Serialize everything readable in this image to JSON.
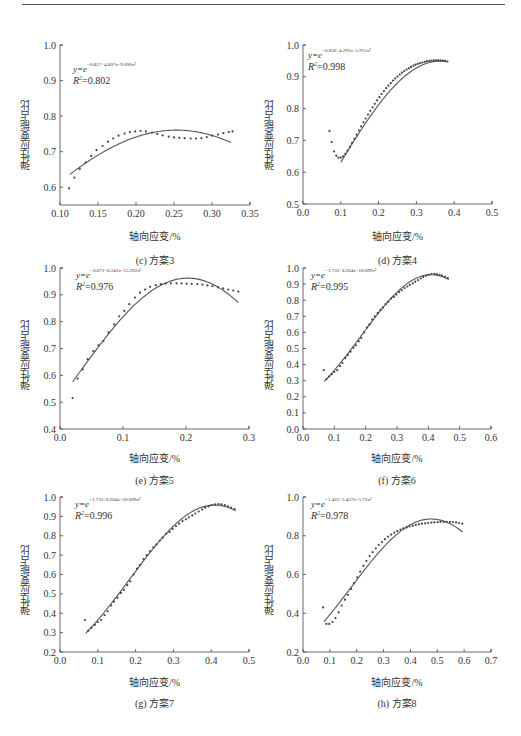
{
  "page": {
    "ylabel": "弹性应变能占比",
    "xlabel": "轴向应变/%"
  },
  "chart_data": [
    {
      "id": "c",
      "type": "scatter",
      "caption": "(c)  方案3",
      "title": "方案3",
      "xlabel": "轴向应变/%",
      "ylabel": "弹性应变能占比",
      "xlim": [
        0.1,
        0.35
      ],
      "ylim": [
        0.55,
        1.0
      ],
      "xticks": [
        "0.10",
        "0.15",
        "0.20",
        "0.25",
        "0.30",
        "0.35"
      ],
      "yticks": [
        "0.6",
        "0.7",
        "0.8",
        "0.9",
        "1.0"
      ],
      "equation": "y=e^(-0.857+4.607x-9.096x^2)",
      "equation_base": "y=e",
      "equation_exp": "−0.857+4.607x−9.096x²",
      "r2": "R²=0.802",
      "r2_value": "0.802",
      "fit": {
        "a": -0.857,
        "b": 4.607,
        "c": -9.096,
        "xrange": [
          0.113,
          0.325
        ]
      },
      "points_x": [
        0.112,
        0.119,
        0.126,
        0.134,
        0.141,
        0.148,
        0.156,
        0.163,
        0.17,
        0.177,
        0.185,
        0.192,
        0.199,
        0.206,
        0.213,
        0.221,
        0.228,
        0.235,
        0.243,
        0.25,
        0.257,
        0.264,
        0.272,
        0.279,
        0.286,
        0.293,
        0.3,
        0.308,
        0.315,
        0.322,
        0.327
      ],
      "points_y": [
        0.597,
        0.627,
        0.651,
        0.67,
        0.688,
        0.704,
        0.716,
        0.728,
        0.737,
        0.745,
        0.751,
        0.755,
        0.757,
        0.758,
        0.757,
        0.754,
        0.75,
        0.746,
        0.742,
        0.74,
        0.739,
        0.738,
        0.737,
        0.737,
        0.738,
        0.741,
        0.745,
        0.748,
        0.752,
        0.755,
        0.757
      ]
    },
    {
      "id": "d",
      "type": "scatter",
      "caption": "(d)  方案4",
      "title": "方案4",
      "xlabel": "轴向应变/%",
      "ylabel": "弹性应变能占比",
      "xlim": [
        0.0,
        0.5
      ],
      "ylim": [
        0.5,
        1.0
      ],
      "xticks": [
        "0.0",
        "0.1",
        "0.2",
        "0.3",
        "0.4",
        "0.5"
      ],
      "yticks": [
        "0.5",
        "0.6",
        "0.7",
        "0.8",
        "0.9",
        "1.0"
      ],
      "equation": "y=e^(-0.830+4.291x-5.915x^2)",
      "equation_base": "y=e",
      "equation_exp": "−0.830+4.291x−5.915x²",
      "r2": "R²=0.998",
      "r2_value": "0.998",
      "fit": {
        "a": -0.83,
        "b": 4.291,
        "c": -5.915,
        "xrange": [
          0.1,
          0.38
        ]
      },
      "points_x": [
        0.07,
        0.076,
        0.082,
        0.088,
        0.094,
        0.1,
        0.106,
        0.112,
        0.118,
        0.124,
        0.13,
        0.136,
        0.142,
        0.148,
        0.154,
        0.16,
        0.166,
        0.172,
        0.178,
        0.184,
        0.19,
        0.196,
        0.202,
        0.208,
        0.214,
        0.22,
        0.226,
        0.232,
        0.238,
        0.244,
        0.25,
        0.256,
        0.262,
        0.268,
        0.274,
        0.28,
        0.286,
        0.292,
        0.298,
        0.304,
        0.31,
        0.316,
        0.322,
        0.328,
        0.334,
        0.34,
        0.346,
        0.352,
        0.358,
        0.364,
        0.37,
        0.376,
        0.382
      ],
      "points_y": [
        0.73,
        0.695,
        0.665,
        0.652,
        0.646,
        0.646,
        0.65,
        0.658,
        0.668,
        0.68,
        0.692,
        0.705,
        0.718,
        0.731,
        0.744,
        0.757,
        0.769,
        0.781,
        0.793,
        0.804,
        0.815,
        0.826,
        0.836,
        0.846,
        0.855,
        0.864,
        0.872,
        0.88,
        0.888,
        0.895,
        0.901,
        0.907,
        0.913,
        0.918,
        0.923,
        0.927,
        0.931,
        0.935,
        0.938,
        0.941,
        0.943,
        0.945,
        0.947,
        0.949,
        0.95,
        0.951,
        0.952,
        0.952,
        0.952,
        0.952,
        0.951,
        0.95,
        0.948
      ]
    },
    {
      "id": "e",
      "type": "scatter",
      "caption": "(e)  方案5",
      "title": "方案5",
      "xlabel": "轴向应变/%",
      "ylabel": "弹性应变能占比",
      "xlim": [
        0.0,
        0.3
      ],
      "ylim": [
        0.4,
        1.0
      ],
      "xticks": [
        "0.0",
        "0.1",
        "0.2",
        "0.3"
      ],
      "yticks": [
        "0.4",
        "0.5",
        "0.6",
        "0.7",
        "0.8",
        "0.9",
        "1.0"
      ],
      "equation": "y=e^(-0.671+6.241x-15.392x^2)",
      "equation_base": "y=e",
      "equation_exp": "−0.671+6.241x−15.392x²",
      "r2": "R²=0.976",
      "r2_value": "0.976",
      "fit": {
        "a": -0.671,
        "b": 6.241,
        "c": -15.392,
        "xrange": [
          0.02,
          0.283
        ]
      },
      "points_x": [
        0.02,
        0.028,
        0.036,
        0.044,
        0.053,
        0.061,
        0.069,
        0.077,
        0.086,
        0.094,
        0.102,
        0.11,
        0.119,
        0.127,
        0.135,
        0.143,
        0.152,
        0.16,
        0.168,
        0.176,
        0.185,
        0.193,
        0.201,
        0.209,
        0.218,
        0.226,
        0.234,
        0.242,
        0.251,
        0.259,
        0.267,
        0.275,
        0.283
      ],
      "points_y": [
        0.515,
        0.588,
        0.622,
        0.66,
        0.69,
        0.712,
        0.728,
        0.76,
        0.79,
        0.82,
        0.84,
        0.865,
        0.89,
        0.908,
        0.92,
        0.93,
        0.936,
        0.94,
        0.942,
        0.943,
        0.943,
        0.943,
        0.942,
        0.941,
        0.94,
        0.938,
        0.935,
        0.932,
        0.928,
        0.924,
        0.92,
        0.916,
        0.912
      ]
    },
    {
      "id": "f",
      "type": "scatter",
      "caption": "(f)  方案6",
      "title": "方案6",
      "xlabel": "轴向应变/%",
      "ylabel": "弹性应变能占比",
      "xlim": [
        0.0,
        0.6
      ],
      "ylim": [
        0.0,
        1.0
      ],
      "xticks": [
        "0.0",
        "0.1",
        "0.2",
        "0.3",
        "0.4",
        "0.5",
        "0.6"
      ],
      "yticks": [
        "0.0",
        "0.1",
        "0.2",
        "0.3",
        "0.4",
        "0.5",
        "0.6",
        "0.7",
        "0.8",
        "0.9",
        "1.0"
      ],
      "equation": "y=e^(-1.733+8.264x-10.099x^2)",
      "equation_base": "y=e",
      "equation_exp": "−1.733+8.264x−10.099x²",
      "r2": "R²=0.995",
      "r2_value": "0.995",
      "fit": {
        "a": -1.733,
        "b": 8.264,
        "c": -10.099,
        "xrange": [
          0.068,
          0.465
        ]
      },
      "points_x": [
        0.066,
        0.075,
        0.083,
        0.092,
        0.1,
        0.109,
        0.118,
        0.126,
        0.135,
        0.143,
        0.152,
        0.161,
        0.169,
        0.178,
        0.186,
        0.195,
        0.204,
        0.212,
        0.221,
        0.229,
        0.238,
        0.247,
        0.255,
        0.264,
        0.272,
        0.281,
        0.29,
        0.298,
        0.307,
        0.315,
        0.324,
        0.333,
        0.341,
        0.35,
        0.358,
        0.367,
        0.376,
        0.384,
        0.393,
        0.401,
        0.41,
        0.419,
        0.427,
        0.436,
        0.444,
        0.453,
        0.462
      ],
      "points_y": [
        0.365,
        0.31,
        0.325,
        0.34,
        0.355,
        0.365,
        0.39,
        0.41,
        0.44,
        0.46,
        0.48,
        0.505,
        0.52,
        0.545,
        0.565,
        0.6,
        0.63,
        0.65,
        0.68,
        0.7,
        0.72,
        0.74,
        0.755,
        0.775,
        0.79,
        0.81,
        0.82,
        0.835,
        0.85,
        0.862,
        0.875,
        0.885,
        0.895,
        0.905,
        0.915,
        0.925,
        0.935,
        0.945,
        0.952,
        0.958,
        0.962,
        0.964,
        0.962,
        0.958,
        0.952,
        0.945,
        0.938
      ]
    },
    {
      "id": "g",
      "type": "scatter",
      "caption": "(g)  方案7",
      "title": "方案7",
      "xlabel": "轴向应变/%",
      "ylabel": "弹性应变能占比",
      "xlim": [
        0.0,
        0.5
      ],
      "ylim": [
        0.2,
        1.0
      ],
      "xticks": [
        "0.0",
        "0.1",
        "0.2",
        "0.3",
        "0.4",
        "0.5"
      ],
      "yticks": [
        "0.2",
        "0.3",
        "0.4",
        "0.5",
        "0.6",
        "0.7",
        "0.8",
        "0.9",
        "1.0"
      ],
      "equation": "y=e^(-1.733+8.264x-10.099x^2)",
      "equation_base": "y=e",
      "equation_exp": "−1.733+8.264x−10.099x²",
      "r2": "R²=0.996",
      "r2_value": "0.996",
      "fit": {
        "a": -1.733,
        "b": 8.264,
        "c": -10.099,
        "xrange": [
          0.068,
          0.465
        ]
      },
      "points_x": [
        0.066,
        0.075,
        0.083,
        0.092,
        0.1,
        0.109,
        0.118,
        0.126,
        0.135,
        0.143,
        0.152,
        0.161,
        0.169,
        0.178,
        0.186,
        0.195,
        0.204,
        0.212,
        0.221,
        0.229,
        0.238,
        0.247,
        0.255,
        0.264,
        0.272,
        0.281,
        0.29,
        0.298,
        0.307,
        0.315,
        0.324,
        0.333,
        0.341,
        0.35,
        0.358,
        0.367,
        0.376,
        0.384,
        0.393,
        0.401,
        0.41,
        0.419,
        0.427,
        0.436,
        0.444,
        0.453,
        0.462
      ],
      "points_y": [
        0.365,
        0.31,
        0.325,
        0.34,
        0.355,
        0.365,
        0.39,
        0.41,
        0.44,
        0.46,
        0.48,
        0.505,
        0.52,
        0.545,
        0.565,
        0.6,
        0.63,
        0.65,
        0.68,
        0.7,
        0.72,
        0.74,
        0.755,
        0.775,
        0.79,
        0.81,
        0.82,
        0.835,
        0.85,
        0.862,
        0.875,
        0.885,
        0.895,
        0.905,
        0.915,
        0.925,
        0.935,
        0.945,
        0.952,
        0.958,
        0.962,
        0.964,
        0.962,
        0.958,
        0.952,
        0.945,
        0.938
      ]
    },
    {
      "id": "h",
      "type": "scatter",
      "caption": "(h)  方案8",
      "title": "方案8",
      "xlabel": "轴向应变/%",
      "ylabel": "弹性应变能占比",
      "xlim": [
        0.0,
        0.7
      ],
      "ylim": [
        0.2,
        1.0
      ],
      "xticks": [
        "0.0",
        "0.1",
        "0.2",
        "0.3",
        "0.4",
        "0.5",
        "0.6",
        "0.7"
      ],
      "yticks": [
        "0.2",
        "0.4",
        "0.6",
        "0.8",
        "1.0"
      ],
      "equation": "y=e^(-1.422+5.457x-5.72x^2)",
      "equation_base": "y=e",
      "equation_exp": "−1.422+5.457x−5.72x²",
      "r2": "R²=0.978",
      "r2_value": "0.978",
      "fit": {
        "a": -1.422,
        "b": 5.457,
        "c": -5.72,
        "xrange": [
          0.078,
          0.595
        ]
      },
      "points_x": [
        0.075,
        0.087,
        0.098,
        0.11,
        0.121,
        0.133,
        0.144,
        0.156,
        0.167,
        0.179,
        0.19,
        0.202,
        0.213,
        0.225,
        0.236,
        0.248,
        0.259,
        0.271,
        0.282,
        0.294,
        0.305,
        0.317,
        0.328,
        0.34,
        0.351,
        0.363,
        0.374,
        0.386,
        0.397,
        0.409,
        0.42,
        0.432,
        0.443,
        0.455,
        0.466,
        0.478,
        0.489,
        0.501,
        0.512,
        0.524,
        0.535,
        0.547,
        0.558,
        0.57,
        0.581,
        0.593
      ],
      "points_y": [
        0.43,
        0.345,
        0.345,
        0.355,
        0.375,
        0.405,
        0.44,
        0.47,
        0.495,
        0.525,
        0.555,
        0.585,
        0.615,
        0.645,
        0.67,
        0.695,
        0.715,
        0.735,
        0.752,
        0.768,
        0.782,
        0.795,
        0.806,
        0.816,
        0.824,
        0.832,
        0.838,
        0.843,
        0.848,
        0.852,
        0.856,
        0.859,
        0.862,
        0.864,
        0.866,
        0.868,
        0.869,
        0.87,
        0.871,
        0.871,
        0.872,
        0.872,
        0.871,
        0.869,
        0.866,
        0.862
      ]
    }
  ]
}
